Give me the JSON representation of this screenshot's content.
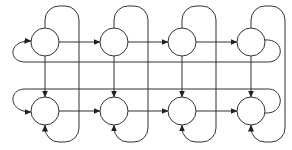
{
  "diagram": {
    "type": "directed-grid-graph",
    "rows": 2,
    "cols": 4,
    "nodes": [
      {
        "id": "r1c1",
        "label": ""
      },
      {
        "id": "r1c2",
        "label": ""
      },
      {
        "id": "r1c3",
        "label": ""
      },
      {
        "id": "r1c4",
        "label": ""
      },
      {
        "id": "r2c1",
        "label": ""
      },
      {
        "id": "r2c2",
        "label": ""
      },
      {
        "id": "r2c3",
        "label": ""
      },
      {
        "id": "r2c4",
        "label": ""
      }
    ],
    "edges": [
      {
        "from": "r1c1",
        "to": "r1c2"
      },
      {
        "from": "r1c2",
        "to": "r1c3"
      },
      {
        "from": "r1c3",
        "to": "r1c4"
      },
      {
        "from": "r2c1",
        "to": "r2c2"
      },
      {
        "from": "r2c2",
        "to": "r2c3"
      },
      {
        "from": "r2c3",
        "to": "r2c4"
      },
      {
        "from": "r1c1",
        "to": "r2c1"
      },
      {
        "from": "r1c2",
        "to": "r2c2"
      },
      {
        "from": "r1c3",
        "to": "r2c3"
      },
      {
        "from": "r1c4",
        "to": "r2c4"
      },
      {
        "from": "r1c4",
        "to": "r1c1",
        "note": "wrap-around row 1"
      },
      {
        "from": "r2c4",
        "to": "r2c1",
        "note": "wrap-around row 2"
      },
      {
        "from": "r1c1",
        "to": "r2c1",
        "note": "loop around column 1"
      },
      {
        "from": "r1c2",
        "to": "r2c2",
        "note": "loop around column 2"
      },
      {
        "from": "r1c3",
        "to": "r2c3",
        "note": "loop around column 3"
      },
      {
        "from": "r1c4",
        "to": "r2c4",
        "note": "loop around column 4"
      }
    ],
    "colors": {
      "stroke": "#333333",
      "background": "#ffffff"
    }
  }
}
